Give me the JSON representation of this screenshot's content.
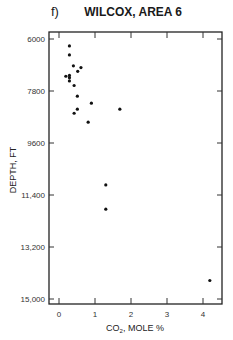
{
  "chart_data": {
    "type": "scatter",
    "panel": "f)",
    "title": "WILCOX, AREA 6",
    "xlabel": "CO2, MOLE %",
    "ylabel": "DEPTH, FT",
    "xlim": [
      0,
      4.5
    ],
    "ylim": [
      15000,
      6000
    ],
    "y_inverted": true,
    "xticks": [
      0,
      1,
      2,
      3,
      4
    ],
    "xtick_labels": [
      "0",
      "1",
      "2",
      "3",
      "4"
    ],
    "yticks": [
      6000,
      7800,
      9600,
      11400,
      13200,
      15000
    ],
    "ytick_labels": [
      "6000",
      "7800",
      "9600",
      "11,400",
      "13,200",
      "15,000"
    ],
    "grid": false,
    "legend": null,
    "points": [
      {
        "x": 0.29,
        "y": 6240
      },
      {
        "x": 0.29,
        "y": 6550
      },
      {
        "x": 0.4,
        "y": 6930
      },
      {
        "x": 0.61,
        "y": 6990
      },
      {
        "x": 0.52,
        "y": 7120
      },
      {
        "x": 0.19,
        "y": 7290
      },
      {
        "x": 0.29,
        "y": 7260
      },
      {
        "x": 0.29,
        "y": 7340
      },
      {
        "x": 0.29,
        "y": 7450
      },
      {
        "x": 0.42,
        "y": 7610
      },
      {
        "x": 0.51,
        "y": 7980
      },
      {
        "x": 0.9,
        "y": 8220
      },
      {
        "x": 1.69,
        "y": 8430
      },
      {
        "x": 0.51,
        "y": 8430
      },
      {
        "x": 0.42,
        "y": 8570
      },
      {
        "x": 0.81,
        "y": 8880
      },
      {
        "x": 1.3,
        "y": 11050
      },
      {
        "x": 1.3,
        "y": 11890
      },
      {
        "x": 4.19,
        "y": 14360
      }
    ]
  },
  "header": {
    "panel": "f)",
    "title": "WILCOX, AREA 6"
  },
  "axes": {
    "xlabel_main": "CO",
    "xlabel_sub": "2",
    "xlabel_rest": ",  MOLE  %",
    "ylabel": "DEPTH, FT"
  }
}
